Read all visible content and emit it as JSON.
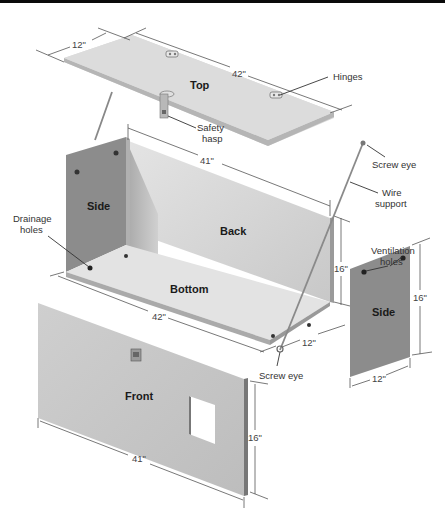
{
  "diagram": {
    "type": "exploded-assembly",
    "panels": {
      "top": {
        "label": "Top",
        "width": "42\"",
        "depth": "12\""
      },
      "back": {
        "label": "Back",
        "width": "41\"",
        "height": "16\""
      },
      "side_left": {
        "label": "Side"
      },
      "bottom": {
        "label": "Bottom",
        "width": "42\"",
        "depth": "12\""
      },
      "side_right": {
        "label": "Side",
        "height": "16\"",
        "width": "12\""
      },
      "front": {
        "label": "Front",
        "width": "41\"",
        "height": "16\""
      }
    },
    "callouts": {
      "hinges": "Hinges",
      "safety_hasp_line1": "Safety",
      "safety_hasp_line2": "hasp",
      "screw_eye_top": "Screw eye",
      "wire_support_line1": "Wire",
      "wire_support_line2": "support",
      "ventilation_line1": "Ventilation",
      "ventilation_line2": "holes",
      "drainage_line1": "Drainage",
      "drainage_line2": "holes",
      "screw_eye_bottom": "Screw eye"
    },
    "colors": {
      "top_panel": "#d9d9d9",
      "back_panel": "#d6d6d6",
      "side_panel": "#8c8c8c",
      "bottom_panel": "#e3e3e3",
      "front_panel": "#c8c8c8",
      "edge": "#a0a0a0",
      "background": "#ffffff"
    }
  }
}
